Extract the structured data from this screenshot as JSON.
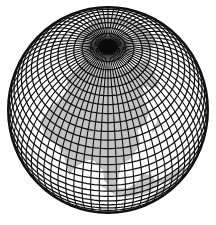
{
  "figure": {
    "projection": "orthographic",
    "view_center": {
      "lat": 52,
      "lon": 100
    },
    "graticule_step_deg": 5,
    "colors": {
      "background": "#ffffff",
      "ocean": "#ffffff",
      "land": "#c4c4c4",
      "grid": "#111111",
      "outline": "#111111"
    },
    "geometry": {
      "cx": 108,
      "cy": 110,
      "rx": 100,
      "ry": 103
    },
    "land_regions": [
      "north-asia",
      "arctic-rim",
      "east-asia",
      "southeast-asia",
      "north-america-edge"
    ]
  }
}
